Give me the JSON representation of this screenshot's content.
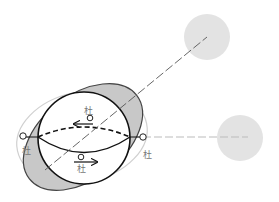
{
  "diagram": {
    "type": "tidal-bulge-illustration",
    "colors": {
      "background": "#ffffff",
      "body_outline": "#111111",
      "bulge_fill": "#c8c8c8",
      "bulge_outline": "#444444",
      "outer_ellipse": "#cfcfcf",
      "external_body": "#e3e3e3",
      "axis_line": "#555555",
      "horizontal_line": "#bbbbbb"
    },
    "labels": {
      "top": "杜",
      "bottom": "杜",
      "left": "杜",
      "right": "杜"
    },
    "arrows": {
      "top": "left",
      "bottom": "right"
    },
    "external_bodies": [
      {
        "name": "upper-right-body",
        "cx": 207,
        "cy": 37,
        "r": 23
      },
      {
        "name": "right-body",
        "cx": 240,
        "cy": 138,
        "r": 23
      }
    ]
  }
}
